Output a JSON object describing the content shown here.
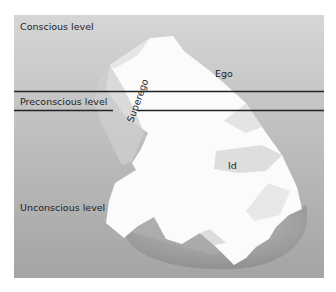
{
  "diagram": {
    "type": "iceberg-model",
    "levels": [
      {
        "id": "conscious",
        "label": "Conscious level"
      },
      {
        "id": "preconscious",
        "label": "Preconscious level"
      },
      {
        "id": "unconscious",
        "label": "Unconscious level"
      }
    ],
    "structures": {
      "ego": "Ego",
      "superego": "Superego",
      "id": "Id"
    },
    "colors": {
      "background_top": "#d4d4d4",
      "background_bottom": "#a2a2a2",
      "iceberg": "#fafafa",
      "iceberg_shadow": "#e2e2e2",
      "underside": "#9a9a9a",
      "divider_line": "#222222"
    }
  }
}
